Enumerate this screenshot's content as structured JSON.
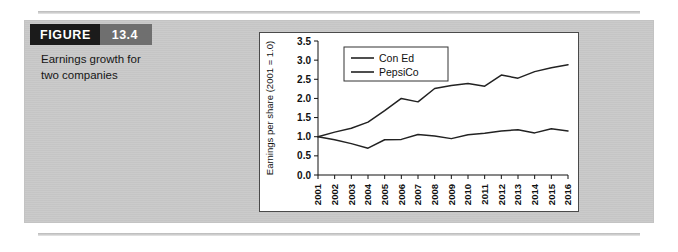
{
  "figure": {
    "badge_label": "FIGURE",
    "badge_number": "13.4",
    "caption_line1": "Earnings growth for",
    "caption_line2": "two companies",
    "panel_color": "#c9c9c9",
    "badge_dark_color": "#1b1b1b",
    "badge_gray_color": "#6f6f6f"
  },
  "chart_data": {
    "type": "line",
    "title": "",
    "xlabel": "",
    "ylabel": "Earnings per share (2001 = 1.0)",
    "grid": false,
    "legend_position": "top-left",
    "ylim": [
      0.0,
      3.5
    ],
    "ytick_labels": [
      "0.0",
      "0.5",
      "1.0",
      "1.5",
      "2.0",
      "2.5",
      "3.0",
      "3.5"
    ],
    "ytick_values": [
      0.0,
      0.5,
      1.0,
      1.5,
      2.0,
      2.5,
      3.0,
      3.5
    ],
    "categories": [
      "2001",
      "2002",
      "2003",
      "2004",
      "2005",
      "2006",
      "2007",
      "2008",
      "2009",
      "2010",
      "2011",
      "2012",
      "2013",
      "2014",
      "2015",
      "2016"
    ],
    "x": [
      2001,
      2002,
      2003,
      2004,
      2005,
      2006,
      2007,
      2008,
      2009,
      2010,
      2011,
      2012,
      2013,
      2014,
      2015,
      2016
    ],
    "series": [
      {
        "name": "Con Ed",
        "color": "#222222",
        "values": [
          1.0,
          1.12,
          1.22,
          1.38,
          1.68,
          2.0,
          1.91,
          2.26,
          2.34,
          2.39,
          2.32,
          2.61,
          2.53,
          2.7,
          2.8,
          2.88
        ]
      },
      {
        "name": "PepsiCo",
        "color": "#222222",
        "values": [
          1.0,
          0.92,
          0.82,
          0.7,
          0.92,
          0.93,
          1.06,
          1.02,
          0.95,
          1.05,
          1.09,
          1.15,
          1.18,
          1.1,
          1.21,
          1.15
        ]
      }
    ]
  }
}
